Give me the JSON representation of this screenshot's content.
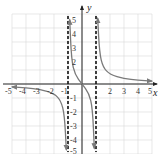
{
  "chart_data": {
    "type": "line",
    "title": "",
    "xlabel": "x",
    "ylabel": "y",
    "xlim": [
      -5,
      5
    ],
    "ylim": [
      -5,
      5
    ],
    "grid": true,
    "x_ticks": [
      "-5",
      "-4",
      "-3",
      "-2",
      "-1",
      "1",
      "2",
      "3",
      "4",
      "5"
    ],
    "y_ticks": [
      "5",
      "4",
      "3",
      "2",
      "1",
      "-1",
      "-2",
      "-3",
      "-4",
      "-5"
    ],
    "vertical_asymptotes": [
      -1,
      1
    ],
    "horizontal_asymptote": 0,
    "series": [
      {
        "name": "left branch (x < -1)",
        "points": [
          [
            -5,
            -0.21
          ],
          [
            -4,
            -0.27
          ],
          [
            -3,
            -0.38
          ],
          [
            -2,
            -0.67
          ],
          [
            -1.5,
            -1.2
          ],
          [
            -1.25,
            -2.22
          ],
          [
            -1.12,
            -4.7
          ]
        ],
        "arrows": [
          "left",
          "down"
        ]
      },
      {
        "name": "middle branch (-1 < x < 1)",
        "points": [
          [
            -0.88,
            4.6
          ],
          [
            -0.75,
            1.71
          ],
          [
            -0.5,
            0.67
          ],
          [
            0,
            0
          ],
          [
            0.5,
            -0.67
          ],
          [
            0.75,
            -1.71
          ],
          [
            0.88,
            -4.6
          ]
        ],
        "arrows": [
          "up",
          "down"
        ]
      },
      {
        "name": "right branch (x > 1)",
        "points": [
          [
            1.12,
            4.7
          ],
          [
            1.25,
            2.22
          ],
          [
            1.5,
            1.2
          ],
          [
            2,
            0.67
          ],
          [
            3,
            0.38
          ],
          [
            4,
            0.27
          ],
          [
            5,
            0.21
          ]
        ],
        "arrows": [
          "up",
          "right"
        ]
      }
    ],
    "colors": {
      "curve": "#7a7a7a",
      "asymptote": "#111111",
      "axis": "#222222",
      "grid": "#d9d9d9"
    }
  },
  "labels": {
    "x_axis": "x",
    "y_axis": "y",
    "x_neg": [
      "-5",
      "-4",
      "-3",
      "-2",
      "-1"
    ],
    "x_pos": [
      "2",
      "3",
      "4",
      "5"
    ],
    "y_pos": [
      "5",
      "4",
      "3",
      "2"
    ],
    "y_neg": [
      "-1",
      "-2",
      "-3",
      "-4",
      "-5"
    ]
  }
}
